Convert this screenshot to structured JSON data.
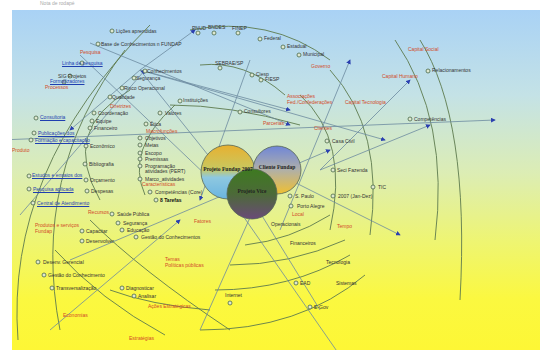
{
  "caption": "Nota de rodapé",
  "colors": {
    "bg_top": "#a9d2f5",
    "bg_bottom": "#fdf735",
    "category_text": "#d24a2a",
    "link_text": "#1f3fb0",
    "line": "#5a7a5a",
    "arrow": "#2a3fb0"
  },
  "center_circles": [
    {
      "id": "c1",
      "label": "Projeto Fundap 2007",
      "x": 228,
      "y": 172,
      "r": 27
    },
    {
      "id": "c2",
      "label": "Cliente Fundap",
      "x": 277,
      "y": 170,
      "r": 24
    },
    {
      "id": "c3",
      "label": "Projeto Vice",
      "x": 252,
      "y": 194,
      "r": 25
    }
  ],
  "labels": [
    {
      "t": "Lições aprendidas",
      "x": 116,
      "y": 31
    },
    {
      "t": "Base de Conhecimentos n FUNDAP",
      "x": 101,
      "y": 44
    },
    {
      "t": "Pesquisa",
      "x": 80,
      "y": 52,
      "c": "cat"
    },
    {
      "t": "Linha de pesquisa",
      "x": 62,
      "y": 63,
      "c": "link"
    },
    {
      "t": "SIG Projetos",
      "x": 58,
      "y": 76
    },
    {
      "t": "Formalizadores",
      "x": 50,
      "y": 81,
      "c": "link"
    },
    {
      "t": "Processos",
      "x": 45,
      "y": 87,
      "c": "cat"
    },
    {
      "t": "Conhecimentos",
      "x": 147,
      "y": 71
    },
    {
      "t": "Segurança",
      "x": 136,
      "y": 78
    },
    {
      "t": "Risco Operacional",
      "x": 124,
      "y": 88
    },
    {
      "t": "Qualidade",
      "x": 112,
      "y": 97
    },
    {
      "t": "PNUD",
      "x": 192,
      "y": 28
    },
    {
      "t": "BNDES",
      "x": 208,
      "y": 27
    },
    {
      "t": "FINEP",
      "x": 232,
      "y": 28
    },
    {
      "t": "Federal",
      "x": 264,
      "y": 38
    },
    {
      "t": "Estadual",
      "x": 287,
      "y": 46
    },
    {
      "t": "Municipal",
      "x": 303,
      "y": 54
    },
    {
      "t": "Governo",
      "x": 311,
      "y": 66,
      "c": "cat"
    },
    {
      "t": "SEBRAE/SP",
      "x": 215,
      "y": 63
    },
    {
      "t": "Ciesp",
      "x": 256,
      "y": 74
    },
    {
      "t": "FIESP",
      "x": 265,
      "y": 79
    },
    {
      "t": "Associações",
      "x": 287,
      "y": 96,
      "c": "cat"
    },
    {
      "t": "Fed./Confederações",
      "x": 287,
      "y": 102,
      "c": "cat"
    },
    {
      "t": "Instituições",
      "x": 183,
      "y": 100
    },
    {
      "t": "Consultores",
      "x": 244,
      "y": 111
    },
    {
      "t": "Parcerias",
      "x": 263,
      "y": 123,
      "c": "cat"
    },
    {
      "t": "Capital Social",
      "x": 408,
      "y": 49,
      "c": "cat"
    },
    {
      "t": "Relacionamentos",
      "x": 432,
      "y": 70
    },
    {
      "t": "Capital Humano",
      "x": 382,
      "y": 76,
      "c": "cat"
    },
    {
      "t": "Capital Tecnologia",
      "x": 345,
      "y": 102,
      "c": "cat"
    },
    {
      "t": "Competências",
      "x": 414,
      "y": 119
    },
    {
      "t": "Clientes",
      "x": 314,
      "y": 128,
      "c": "cat"
    },
    {
      "t": "Casa Civil",
      "x": 332,
      "y": 141
    },
    {
      "t": "Seci Fazenda",
      "x": 337,
      "y": 170
    },
    {
      "t": "TIC",
      "x": 378,
      "y": 187
    },
    {
      "t": "Consultoria",
      "x": 40,
      "y": 117,
      "c": "link"
    },
    {
      "t": "Publicações dos",
      "x": 38,
      "y": 133,
      "c": "link"
    },
    {
      "t": "Formação e capacitação",
      "x": 35,
      "y": 140,
      "c": "link"
    },
    {
      "t": "Produto",
      "x": 12,
      "y": 150,
      "c": "cat"
    },
    {
      "t": "Estudos e ensaios dos",
      "x": 32,
      "y": 175,
      "c": "link"
    },
    {
      "t": "Pesquisa aplicada",
      "x": 33,
      "y": 189,
      "c": "link"
    },
    {
      "t": "Central de Atendimento",
      "x": 37,
      "y": 203,
      "c": "link"
    },
    {
      "t": "Recursos",
      "x": 88,
      "y": 212,
      "c": "cat"
    },
    {
      "t": "Produtos e serviços",
      "x": 35,
      "y": 225,
      "c": "cat"
    },
    {
      "t": "Fundap",
      "x": 35,
      "y": 231,
      "c": "cat"
    },
    {
      "t": "Diretrizes",
      "x": 110,
      "y": 106,
      "c": "cat"
    },
    {
      "t": "Coordenação",
      "x": 98,
      "y": 113
    },
    {
      "t": "Equipe",
      "x": 96,
      "y": 121
    },
    {
      "t": "Financeiro",
      "x": 94,
      "y": 128
    },
    {
      "t": "Econômico",
      "x": 90,
      "y": 146
    },
    {
      "t": "Bibliografia",
      "x": 89,
      "y": 164
    },
    {
      "t": "Orçamento",
      "x": 90,
      "y": 180
    },
    {
      "t": "Despesas",
      "x": 91,
      "y": 191
    },
    {
      "t": "Valores",
      "x": 165,
      "y": 113
    },
    {
      "t": "Ética",
      "x": 150,
      "y": 124
    },
    {
      "t": "Macrofunções",
      "x": 146,
      "y": 131,
      "c": "cat"
    },
    {
      "t": "Objetivos",
      "x": 145,
      "y": 138
    },
    {
      "t": "Metas",
      "x": 145,
      "y": 145
    },
    {
      "t": "Escopo",
      "x": 145,
      "y": 153
    },
    {
      "t": "Premissas",
      "x": 145,
      "y": 159
    },
    {
      "t": "Programação",
      "x": 145,
      "y": 166
    },
    {
      "t": "atividades (PERT)",
      "x": 145,
      "y": 171
    },
    {
      "t": "Marco_atividades",
      "x": 145,
      "y": 179
    },
    {
      "t": "Características",
      "x": 142,
      "y": 184,
      "c": "cat"
    },
    {
      "t": "Competências (Core)",
      "x": 155,
      "y": 192
    },
    {
      "t": "8 Tarefas",
      "x": 160,
      "y": 200,
      "c": "bold"
    },
    {
      "t": "Fatores",
      "x": 194,
      "y": 221,
      "c": "cat"
    },
    {
      "t": "Saúde Pública",
      "x": 117,
      "y": 214
    },
    {
      "t": "Segurança",
      "x": 123,
      "y": 223
    },
    {
      "t": "Educação",
      "x": 127,
      "y": 230
    },
    {
      "t": "Gestão do Conhecimentos",
      "x": 141,
      "y": 237
    },
    {
      "t": "Capacitar",
      "x": 86,
      "y": 231
    },
    {
      "t": "Desenvolver",
      "x": 86,
      "y": 241
    },
    {
      "t": "Desenv. Gerencial",
      "x": 43,
      "y": 262
    },
    {
      "t": "Gestão do Conhecimento",
      "x": 48,
      "y": 275
    },
    {
      "t": "Transversalização",
      "x": 56,
      "y": 288
    },
    {
      "t": "Diagnosticar",
      "x": 126,
      "y": 288
    },
    {
      "t": "Analisar",
      "x": 138,
      "y": 296
    },
    {
      "t": "Ações Estratégicas",
      "x": 148,
      "y": 306,
      "c": "cat"
    },
    {
      "t": "Temas",
      "x": 165,
      "y": 259,
      "c": "cat"
    },
    {
      "t": "Políticas públicas",
      "x": 165,
      "y": 265,
      "c": "cat"
    },
    {
      "t": "Economias",
      "x": 63,
      "y": 315,
      "c": "cat"
    },
    {
      "t": "Estratégias",
      "x": 129,
      "y": 338,
      "c": "cat"
    },
    {
      "t": "S. Paulo",
      "x": 295,
      "y": 196
    },
    {
      "t": "2007 (Jan-Dez)",
      "x": 338,
      "y": 196
    },
    {
      "t": "Porto Alegre",
      "x": 297,
      "y": 206
    },
    {
      "t": "Local",
      "x": 292,
      "y": 214,
      "c": "cat"
    },
    {
      "t": "Tempo",
      "x": 337,
      "y": 226,
      "c": "cat"
    },
    {
      "t": "Operacionais",
      "x": 271,
      "y": 224
    },
    {
      "t": "Financeiros",
      "x": 290,
      "y": 243
    },
    {
      "t": "Tecnologia",
      "x": 326,
      "y": 262
    },
    {
      "t": "EAD",
      "x": 300,
      "y": 283
    },
    {
      "t": "Sistemas",
      "x": 336,
      "y": 283
    },
    {
      "t": "Internet",
      "x": 225,
      "y": 295
    },
    {
      "t": "E-Gov",
      "x": 314,
      "y": 307
    }
  ],
  "arcs": [
    "M 18 340 Q 5 170 150 25",
    "M 60 330 Q 30 175 125 50",
    "M 100 200 Q 60 130 130 90",
    "M 145 195 Q 125 150 175 105",
    "M 190 30 Q 270 15 330 60",
    "M 200 65 Q 245 60 285 95",
    "M 170 105 Q 230 105 300 125",
    "M 395 40 Q 450 120 435 240",
    "M 330 70 Q 385 130 370 235",
    "M 300 95 Q 350 140 330 230",
    "M 420 40 Q 470 120 460 300",
    "M 90 220 Q 140 270 230 330",
    "M 55 250 Q 100 300 165 335",
    "M 110 290 Q 150 305 210 310",
    "M 245 245 Q 290 240 330 215",
    "M 230 265 Q 290 265 345 240",
    "M 215 290 Q 290 290 350 255",
    "M 200 330 Q 300 330 365 275"
  ],
  "lines": [
    "M 140 70 L 290 110",
    "M 140 70 L 385 140",
    "M 90 43 L 290 125",
    "M 80 55 L 232 200",
    "M 140 70 L 195 30",
    "M 140 70 L 220 170",
    "M 0 140 L 495 120",
    "M 140 70 L 70 130",
    "M 20 215 L 145 70",
    "M 232 200 L 350 370",
    "M 280 230 L 350 60",
    "M 320 170 L 430 125",
    "M 320 170 L 410 80",
    "M 290 180 L 400 235",
    "M 70 260 L 330 150",
    "M 50 330 L 180 220",
    "M 200 330 L 280 150",
    "M 250 60 L 200 200",
    "M 320 310 L 240 180"
  ],
  "nodes": [
    [
      112,
      31
    ],
    [
      98,
      44
    ],
    [
      82,
      63
    ],
    [
      70,
      76
    ],
    [
      64,
      82
    ],
    [
      145,
      71
    ],
    [
      134,
      78
    ],
    [
      122,
      88
    ],
    [
      110,
      97
    ],
    [
      198,
      33
    ],
    [
      214,
      33
    ],
    [
      238,
      33
    ],
    [
      260,
      39
    ],
    [
      283,
      47
    ],
    [
      299,
      55
    ],
    [
      220,
      68
    ],
    [
      252,
      75
    ],
    [
      261,
      80
    ],
    [
      180,
      101
    ],
    [
      240,
      112
    ],
    [
      327,
      141
    ],
    [
      333,
      170
    ],
    [
      373,
      187
    ],
    [
      428,
      71
    ],
    [
      410,
      119
    ],
    [
      36,
      118
    ],
    [
      34,
      133
    ],
    [
      31,
      140
    ],
    [
      29,
      176
    ],
    [
      29,
      189
    ],
    [
      33,
      203
    ],
    [
      94,
      113
    ],
    [
      92,
      121
    ],
    [
      90,
      128
    ],
    [
      86,
      146
    ],
    [
      85,
      164
    ],
    [
      86,
      180
    ],
    [
      87,
      191
    ],
    [
      160,
      113
    ],
    [
      146,
      124
    ],
    [
      140,
      138
    ],
    [
      140,
      145
    ],
    [
      140,
      153
    ],
    [
      140,
      159
    ],
    [
      140,
      166
    ],
    [
      140,
      179
    ],
    [
      150,
      192
    ],
    [
      156,
      200
    ],
    [
      112,
      214
    ],
    [
      118,
      223
    ],
    [
      122,
      230
    ],
    [
      136,
      237
    ],
    [
      82,
      231
    ],
    [
      82,
      241
    ],
    [
      38,
      262
    ],
    [
      44,
      275
    ],
    [
      52,
      288
    ],
    [
      122,
      288
    ],
    [
      134,
      296
    ],
    [
      290,
      196
    ],
    [
      333,
      196
    ],
    [
      291,
      206
    ],
    [
      296,
      283
    ],
    [
      230,
      303
    ],
    [
      310,
      307
    ]
  ]
}
